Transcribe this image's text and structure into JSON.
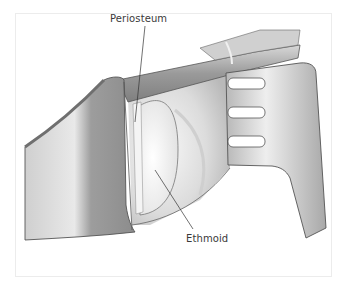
{
  "figure": {
    "type": "surgical-illustration",
    "labels": [
      {
        "id": "periosteum",
        "text": "Periosteum"
      },
      {
        "id": "ethmoid",
        "text": "Ethmoid"
      }
    ]
  },
  "colors": {
    "frame_border": "#ececec",
    "metal_light": "#e6e6e6",
    "metal_mid": "#bdbdbd",
    "metal_dark": "#8a8a8a",
    "outline": "#555555",
    "tissue_light": "#f2f2f2",
    "tissue_shadow": "#c8c8c8",
    "label_text": "#3a3a3a"
  }
}
